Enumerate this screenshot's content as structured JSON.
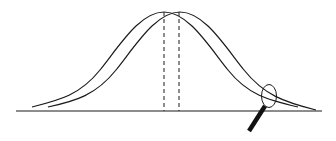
{
  "diagram": {
    "title": "",
    "colors": {
      "background": "#ffffff",
      "stroke": "#1a1a1a"
    },
    "curves": [
      {
        "name": "distribution-a",
        "mean_x": 164,
        "peak_y": 12
      },
      {
        "name": "distribution-b",
        "mean_x": 179,
        "peak_y": 12
      }
    ],
    "mean_lines": [
      {
        "name": "mean-line-a",
        "x": 164
      },
      {
        "name": "mean-line-b",
        "x": 179
      }
    ],
    "magnifier": {
      "icon": "magnifying-glass-icon",
      "lens_center": [
        269,
        96
      ],
      "target": "right tail"
    }
  }
}
